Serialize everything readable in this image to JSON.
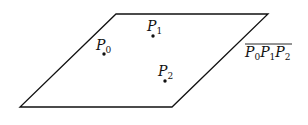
{
  "diagram": {
    "plane": {
      "vertices": [
        [
          116,
          14
        ],
        [
          268,
          14
        ],
        [
          172,
          107
        ],
        [
          20,
          107
        ]
      ],
      "stroke": "#111111"
    },
    "points": [
      {
        "name": "P",
        "sub": "0",
        "x": 104,
        "y": 54,
        "label_x": 96,
        "label_y": 46
      },
      {
        "name": "P",
        "sub": "1",
        "x": 153,
        "y": 36,
        "label_x": 147,
        "label_y": 28
      },
      {
        "name": "P",
        "sub": "2",
        "x": 165,
        "y": 81,
        "label_x": 158,
        "label_y": 73
      }
    ],
    "plane_label": {
      "text": "P0P1P2",
      "parts": [
        {
          "name": "P",
          "sub": "0"
        },
        {
          "name": "P",
          "sub": "1"
        },
        {
          "name": "P",
          "sub": "2"
        }
      ],
      "overline": true
    }
  }
}
